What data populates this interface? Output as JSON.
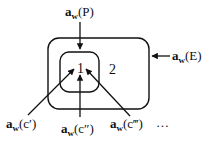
{
  "diagram": {
    "regions": [
      {
        "id": "inner",
        "label": "1"
      },
      {
        "id": "outer",
        "label": "2"
      }
    ],
    "arrows": [
      {
        "id": "p",
        "base": "a",
        "sub": "w",
        "arg": "(P)"
      },
      {
        "id": "e",
        "base": "a",
        "sub": "w",
        "arg": "(E)"
      },
      {
        "id": "c1",
        "base": "a",
        "sub": "w",
        "arg": "(c′)"
      },
      {
        "id": "c2",
        "base": "a",
        "sub": "w",
        "arg": "(c″)"
      },
      {
        "id": "c3",
        "base": "a",
        "sub": "w",
        "arg": "(c‴)"
      }
    ],
    "ellipsis": "…",
    "colors": {
      "stroke": "#111111",
      "background": "#ffffff"
    }
  }
}
